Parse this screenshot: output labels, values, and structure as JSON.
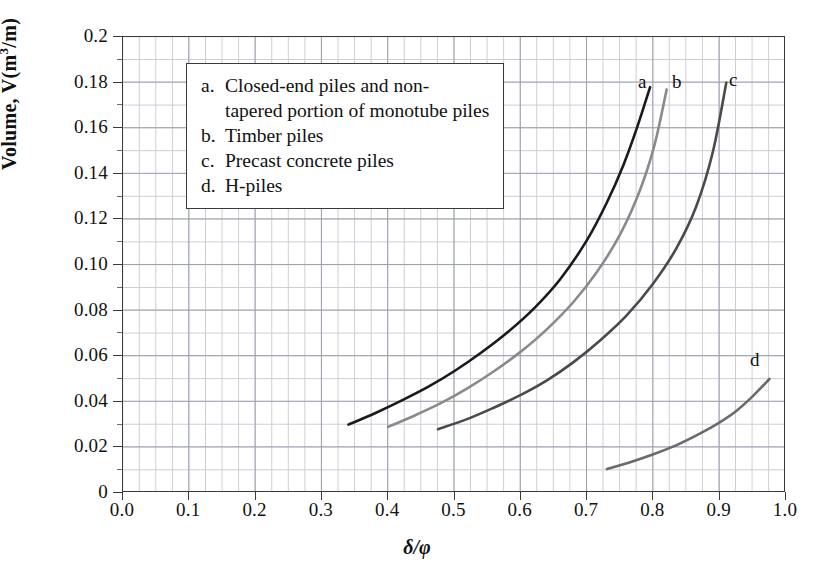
{
  "figure": {
    "background_color": "#ffffff",
    "frame_color": "#3a3a3a",
    "grid_minor_color": "#c9ccd6",
    "grid_major_color": "#9ba0ad"
  },
  "axes": {
    "y_title_prefix": "Volume, V(m",
    "y_title_sup": "3",
    "y_title_suffix": "/m)",
    "x_title": "δ/φ",
    "y_ticks": [
      "0",
      "0.02",
      "0.04",
      "0.06",
      "0.08",
      "0.10",
      "0.12",
      "0.14",
      "0.16",
      "0.18",
      "0.2"
    ],
    "x_ticks": [
      "0.0",
      "0.1",
      "0.2",
      "0.3",
      "0.4",
      "0.5",
      "0.6",
      "0.7",
      "0.8",
      "0.9",
      "1.0"
    ]
  },
  "legend": {
    "rows": [
      {
        "key": "a.",
        "text": "Closed-end piles and non-",
        "continuation": "tapered portion of monotube piles"
      },
      {
        "key": "b.",
        "text": "Timber piles"
      },
      {
        "key": "c.",
        "text": "Precast concrete piles"
      },
      {
        "key": "d.",
        "text": "H-piles"
      }
    ]
  },
  "curve_labels": [
    {
      "id": "a",
      "text": "a"
    },
    {
      "id": "b",
      "text": "b"
    },
    {
      "id": "c",
      "text": "c"
    },
    {
      "id": "d",
      "text": "d"
    }
  ],
  "chart_data": {
    "type": "line",
    "title": "",
    "xlabel": "δ/φ",
    "ylabel": "Volume, V(m3/m)",
    "xlim": [
      0.0,
      1.0
    ],
    "ylim": [
      0.0,
      0.2
    ],
    "xticks": [
      0.0,
      0.1,
      0.2,
      0.3,
      0.4,
      0.5,
      0.6,
      0.7,
      0.8,
      0.9,
      1.0
    ],
    "yticks": [
      0.0,
      0.02,
      0.04,
      0.06,
      0.08,
      0.1,
      0.12,
      0.14,
      0.16,
      0.18,
      0.2
    ],
    "grid": true,
    "minor_grid": true,
    "x_minor_step": 0.025,
    "y_minor_step": 0.005,
    "legend_position": "inside-upper-left",
    "series": [
      {
        "name": "a",
        "label": "Closed-end piles and non-tapered portion of monotube piles",
        "color": "#1a1a1a",
        "linewidth": 2.6,
        "x": [
          0.34,
          0.38,
          0.42,
          0.46,
          0.5,
          0.54,
          0.58,
          0.62,
          0.66,
          0.7,
          0.73,
          0.755,
          0.775,
          0.795
        ],
        "y": [
          0.03,
          0.035,
          0.0405,
          0.0465,
          0.0535,
          0.0615,
          0.0705,
          0.081,
          0.094,
          0.111,
          0.1275,
          0.144,
          0.16,
          0.178
        ]
      },
      {
        "name": "b",
        "label": "Timber piles",
        "color": "#8a8a8a",
        "linewidth": 2.6,
        "x": [
          0.4,
          0.44,
          0.48,
          0.52,
          0.56,
          0.6,
          0.64,
          0.68,
          0.715,
          0.75,
          0.78,
          0.802,
          0.82
        ],
        "y": [
          0.029,
          0.034,
          0.0395,
          0.046,
          0.0535,
          0.062,
          0.072,
          0.084,
          0.097,
          0.1135,
          0.133,
          0.153,
          0.177
        ]
      },
      {
        "name": "c",
        "label": "Precast concrete piles",
        "color": "#4a4a4a",
        "linewidth": 2.6,
        "x": [
          0.475,
          0.52,
          0.56,
          0.6,
          0.64,
          0.68,
          0.72,
          0.76,
          0.8,
          0.835,
          0.865,
          0.89,
          0.91
        ],
        "y": [
          0.028,
          0.0325,
          0.0375,
          0.043,
          0.0495,
          0.0575,
          0.067,
          0.078,
          0.092,
          0.1075,
          0.126,
          0.15,
          0.18
        ]
      },
      {
        "name": "d",
        "label": "H-piles",
        "color": "#6a6a6a",
        "linewidth": 2.6,
        "x": [
          0.73,
          0.765,
          0.8,
          0.835,
          0.87,
          0.9,
          0.925,
          0.95,
          0.975
        ],
        "y": [
          0.0105,
          0.0135,
          0.017,
          0.021,
          0.026,
          0.031,
          0.036,
          0.0425,
          0.05
        ]
      }
    ]
  }
}
